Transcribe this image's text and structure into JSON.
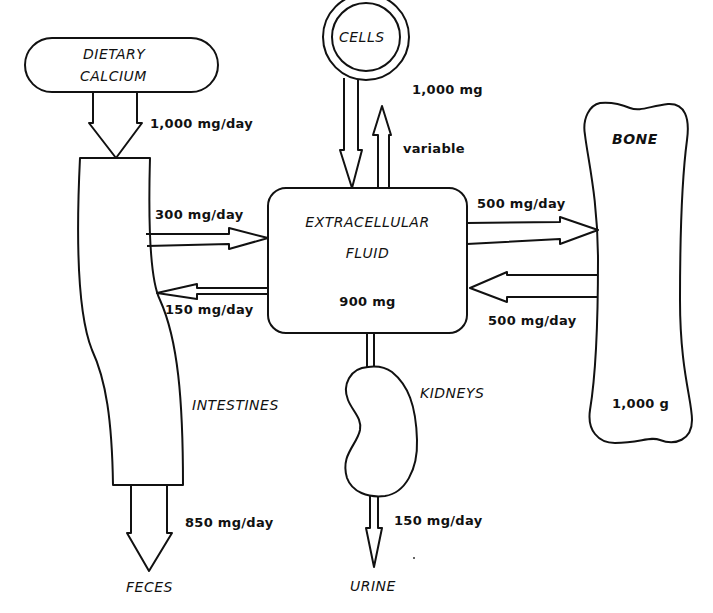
{
  "colors": {
    "stroke": "#111111",
    "background": "#ffffff"
  },
  "nodes": {
    "dietary_calcium": {
      "line1": "DIETARY",
      "line2": "CALCIUM"
    },
    "cells": {
      "label": "CELLS",
      "amount": "1,000 mg"
    },
    "extracellular_fluid": {
      "line1": "EXTRACELLULAR",
      "line2": "FLUID",
      "amount": "900 mg"
    },
    "bone": {
      "label": "BONE",
      "amount": "1,000 g"
    },
    "intestines": {
      "label": "INTESTINES"
    },
    "kidneys": {
      "label": "KIDNEYS"
    },
    "feces": {
      "label": "FECES"
    },
    "urine": {
      "label": "URINE"
    }
  },
  "flows": {
    "diet_to_intestines": "1,000 mg/day",
    "cells_exchange": "variable",
    "intestines_to_ecf": "300 mg/day",
    "ecf_to_intestines": "150 mg/day",
    "ecf_to_bone": "500 mg/day",
    "bone_to_ecf": "500 mg/day",
    "intestines_to_feces": "850 mg/day",
    "kidneys_to_urine": "150 mg/day"
  }
}
